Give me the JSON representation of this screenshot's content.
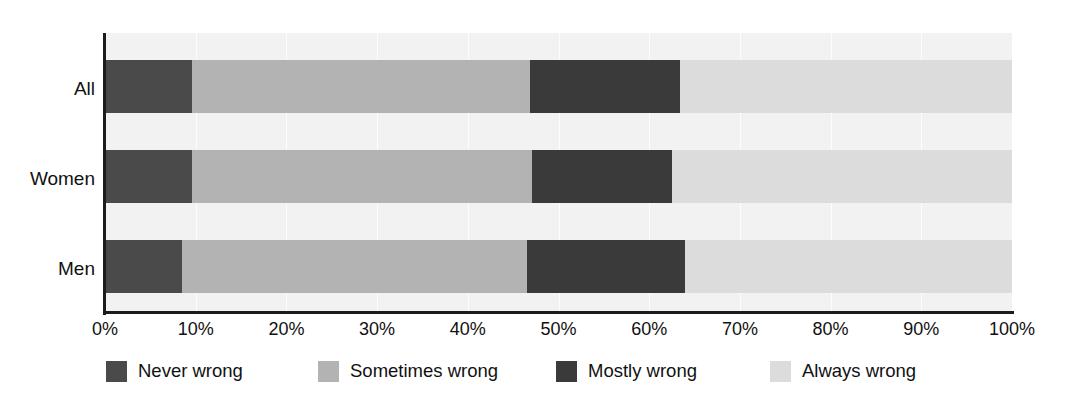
{
  "chart_data": {
    "type": "bar",
    "orientation": "horizontal",
    "stacked": true,
    "stack_mode": "percent",
    "title": "",
    "subtitle": "",
    "xlabel": "",
    "ylabel": "",
    "xlim": [
      0,
      100
    ],
    "grid": true,
    "grid_axis": "x",
    "legend_position": "bottom",
    "categories": [
      "All",
      "Women",
      "Men"
    ],
    "tick_labels": [
      "0%",
      "10%",
      "20%",
      "30%",
      "40%",
      "50%",
      "60%",
      "70%",
      "80%",
      "90%",
      "100%"
    ],
    "tick_values": [
      0,
      10,
      20,
      30,
      40,
      50,
      60,
      70,
      80,
      90,
      100
    ],
    "series": [
      {
        "name": "Never wrong",
        "color": "#4a4a4a",
        "values": [
          9.6,
          9.6,
          8.5
        ]
      },
      {
        "name": "Sometimes wrong",
        "color": "#b3b3b3",
        "values": [
          37.3,
          37.5,
          38.0
        ]
      },
      {
        "name": "Mostly wrong",
        "color": "#3a3a3a",
        "values": [
          16.5,
          15.4,
          17.4
        ]
      },
      {
        "name": "Always wrong",
        "color": "#dcdcdc",
        "values": [
          36.6,
          37.5,
          36.1
        ]
      }
    ]
  },
  "axis": {
    "line_color": "#1c1c1c",
    "plot_background": "#f2f2f2"
  },
  "legend": {
    "items": [
      {
        "label": "Never wrong",
        "color": "#4a4a4a"
      },
      {
        "label": "Sometimes wrong",
        "color": "#b3b3b3"
      },
      {
        "label": "Mostly wrong",
        "color": "#3a3a3a"
      },
      {
        "label": "Always wrong",
        "color": "#dcdcdc"
      }
    ]
  }
}
